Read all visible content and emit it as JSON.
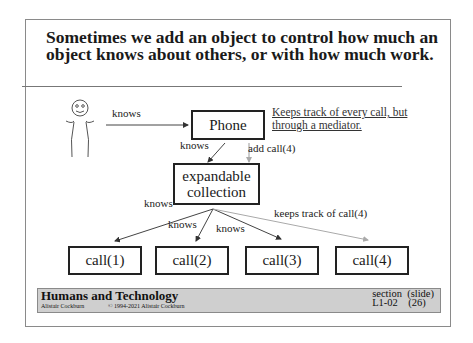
{
  "slide": {
    "title": "Sometimes we add an object to control how much an object knows about others, or with how much work.",
    "title_line1": "Sometimes we add an object to control how much an",
    "title_line2": "object knows about others, or with how much work."
  },
  "diagram": {
    "actor_label": "knows",
    "phone": {
      "label": "Phone"
    },
    "note_line1": "Keeps track of every call, but",
    "note_line2": "through a mediator.",
    "phone_to_collection_label": "knows",
    "add_call_label": "add call(4)",
    "collection": {
      "line1": "expandable",
      "line2": "collection"
    },
    "collection_left_label": "knows",
    "edge_labels": [
      "knows",
      "knows"
    ],
    "keeps_track_label": "keeps track of call(4)",
    "calls": [
      "call(1)",
      "call(2)",
      "call(3)",
      "call(4)"
    ]
  },
  "footer": {
    "course_title": "Humans and Technology",
    "author": "Alistair Cockburn",
    "copyright": "© 1994-2021 Alistair Cockburn",
    "section_header": "section  (slide)",
    "section_value": "L1-02    (26)"
  }
}
